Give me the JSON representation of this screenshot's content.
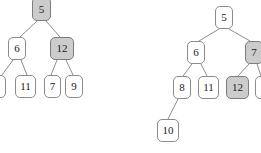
{
  "figure": {
    "kind": "binary-tree-diagram",
    "width": 261,
    "height": 153,
    "background_color": "#ffffff",
    "node_fill_default": "#ffffff",
    "node_fill_shaded": "#cccccc",
    "node_border_color": "#8c8c8c",
    "edge_color": "#8c8c8c",
    "text_color": "#1b1b1b"
  },
  "trees": [
    {
      "id": "left-tree",
      "nodes": [
        {
          "id": "L-5",
          "label": "5",
          "x": 32,
          "y": -3,
          "w": 19,
          "h": 24,
          "shaded": true,
          "clipped": "top"
        },
        {
          "id": "L-6",
          "label": "6",
          "x": 8,
          "y": 37,
          "w": 18,
          "h": 23,
          "shaded": false,
          "clipped": "none"
        },
        {
          "id": "L-12",
          "label": "12",
          "x": 50,
          "y": 37,
          "w": 24,
          "h": 23,
          "shaded": true,
          "clipped": "none"
        },
        {
          "id": "L-8",
          "label": "",
          "x": -12,
          "y": 75,
          "w": 18,
          "h": 23,
          "shaded": false,
          "clipped": "left"
        },
        {
          "id": "L-11",
          "label": "11",
          "x": 15,
          "y": 75,
          "w": 21,
          "h": 23,
          "shaded": false,
          "clipped": "none"
        },
        {
          "id": "L-7",
          "label": "7",
          "x": 44,
          "y": 75,
          "w": 17,
          "h": 23,
          "shaded": false,
          "clipped": "none"
        },
        {
          "id": "L-9",
          "label": "9",
          "x": 65,
          "y": 75,
          "w": 18,
          "h": 23,
          "shaded": false,
          "clipped": "none"
        }
      ],
      "edges": [
        {
          "from": "L-5",
          "to": "L-6",
          "x1": 37,
          "y1": 21,
          "x2": 20,
          "y2": 37
        },
        {
          "from": "L-5",
          "to": "L-12",
          "x1": 46,
          "y1": 21,
          "x2": 60,
          "y2": 37
        },
        {
          "from": "L-6",
          "to": "L-8",
          "x1": 13,
          "y1": 60,
          "x2": 2,
          "y2": 75
        },
        {
          "from": "L-6",
          "to": "L-11",
          "x1": 21,
          "y1": 60,
          "x2": 27,
          "y2": 75
        },
        {
          "from": "L-12",
          "to": "L-7",
          "x1": 57,
          "y1": 60,
          "x2": 51,
          "y2": 75
        },
        {
          "from": "L-12",
          "to": "L-9",
          "x1": 66,
          "y1": 60,
          "x2": 73,
          "y2": 75
        }
      ]
    },
    {
      "id": "right-tree",
      "nodes": [
        {
          "id": "R-5",
          "label": "5",
          "x": 215,
          "y": 6,
          "w": 18,
          "h": 23,
          "shaded": false,
          "clipped": "none"
        },
        {
          "id": "R-6",
          "label": "6",
          "x": 187,
          "y": 41,
          "w": 18,
          "h": 23,
          "shaded": false,
          "clipped": "none"
        },
        {
          "id": "R-7",
          "label": "7",
          "x": 245,
          "y": 41,
          "w": 18,
          "h": 23,
          "shaded": true,
          "clipped": "right"
        },
        {
          "id": "R-8",
          "label": "8",
          "x": 173,
          "y": 76,
          "w": 18,
          "h": 23,
          "shaded": false,
          "clipped": "none"
        },
        {
          "id": "R-11",
          "label": "11",
          "x": 198,
          "y": 76,
          "w": 21,
          "h": 23,
          "shaded": false,
          "clipped": "none"
        },
        {
          "id": "R-12",
          "label": "12",
          "x": 226,
          "y": 76,
          "w": 23,
          "h": 23,
          "shaded": true,
          "clipped": "none"
        },
        {
          "id": "R-9",
          "label": "",
          "x": 255,
          "y": 76,
          "w": 18,
          "h": 23,
          "shaded": false,
          "clipped": "right"
        },
        {
          "id": "R-10",
          "label": "10",
          "x": 157,
          "y": 119,
          "w": 22,
          "h": 23,
          "shaded": false,
          "clipped": "none"
        }
      ],
      "edges": [
        {
          "from": "R-5",
          "to": "R-6",
          "x1": 219,
          "y1": 29,
          "x2": 199,
          "y2": 41
        },
        {
          "from": "R-5",
          "to": "R-7",
          "x1": 229,
          "y1": 29,
          "x2": 250,
          "y2": 41
        },
        {
          "from": "R-6",
          "to": "R-8",
          "x1": 192,
          "y1": 64,
          "x2": 183,
          "y2": 76
        },
        {
          "from": "R-6",
          "to": "R-11",
          "x1": 201,
          "y1": 64,
          "x2": 207,
          "y2": 76
        },
        {
          "from": "R-7",
          "to": "R-12",
          "x1": 249,
          "y1": 64,
          "x2": 238,
          "y2": 76
        },
        {
          "from": "R-7",
          "to": "R-9",
          "x1": 257,
          "y1": 64,
          "x2": 261,
          "y2": 76
        },
        {
          "from": "R-8",
          "to": "R-10",
          "x1": 178,
          "y1": 99,
          "x2": 168,
          "y2": 119
        }
      ]
    }
  ]
}
